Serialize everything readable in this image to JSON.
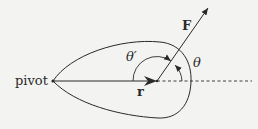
{
  "diagram": {
    "labels": {
      "pivot": "pivot",
      "force": "F",
      "position": "r",
      "theta": "θ",
      "theta_prime": "θ′"
    },
    "colors": {
      "background": "#f3f3f1",
      "stroke": "#2a2a2a"
    },
    "points": {
      "pivot": [
        53,
        81
      ],
      "force_origin": [
        157,
        81
      ],
      "force_tip": [
        208,
        8
      ],
      "dashed_end": [
        252,
        81
      ]
    }
  }
}
